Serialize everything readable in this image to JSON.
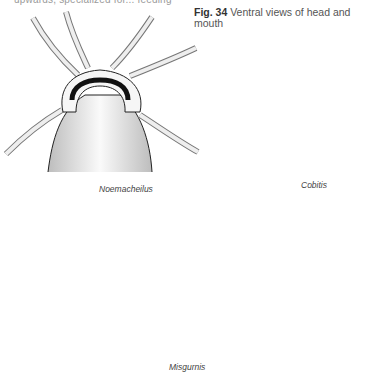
{
  "page": {
    "cutoff_text": "upwards, specialized for... feeding",
    "figure": {
      "number_label": "Fig. 34",
      "caption": "Ventral views of head and mouth"
    },
    "illustrations": [
      {
        "name": "Noemacheilus",
        "barbel_count": 6
      },
      {
        "name": "Cobitis",
        "barbel_count": 6
      },
      {
        "name": "Misgurnis",
        "barbel_count": 10
      }
    ]
  }
}
